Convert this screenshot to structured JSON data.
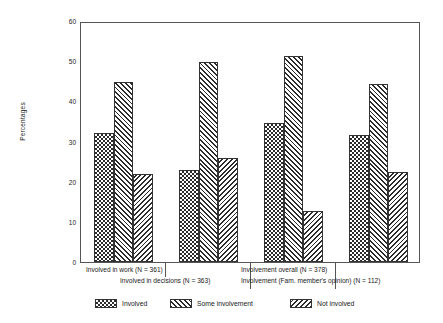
{
  "chart_data": {
    "type": "bar",
    "title": "",
    "xlabel": "",
    "ylabel": "Percentages",
    "ylim": [
      0,
      60
    ],
    "yticks": [
      0,
      10,
      20,
      30,
      40,
      50,
      60
    ],
    "grid": false,
    "legend_position": "bottom",
    "categories": [
      "Involved in work (N = 361)",
      "Involved in decisions (N = 363)",
      "Involvement overall (N = 378)",
      "Involvement (Fam. member's opinion) (N = 112)"
    ],
    "series": [
      {
        "name": "Involved",
        "pattern": "checkerboard",
        "values": [
          32.0,
          22.8,
          34.7,
          31.5
        ]
      },
      {
        "name": "Some involvement",
        "pattern": "diagonal-forward",
        "values": [
          44.7,
          49.8,
          51.4,
          44.3
        ]
      },
      {
        "name": "Not involved",
        "pattern": "diagonal-backward",
        "values": [
          21.8,
          25.8,
          12.6,
          22.4
        ]
      }
    ],
    "legend": [
      "Involved",
      "Some involvement",
      "Not involved"
    ],
    "colors": {
      "ink": "#2b2b2b",
      "frame": "#555555",
      "background": "#ffffff"
    }
  },
  "axis": {
    "y_tick_labels": [
      "0",
      "10",
      "20",
      "30",
      "40",
      "50",
      "60"
    ],
    "y_title": "Percentages"
  },
  "legend": {
    "items": [
      {
        "label": "Involved"
      },
      {
        "label": "Some involvement"
      },
      {
        "label": "Not involved"
      }
    ]
  },
  "category_labels": {
    "row1": [
      "Involved in work (N = 361)",
      "Involvement overall (N = 378)"
    ],
    "row2": [
      "Involved in decisions (N = 363)",
      "Involvement (Fam. member's opinion) (N = 112)"
    ]
  }
}
